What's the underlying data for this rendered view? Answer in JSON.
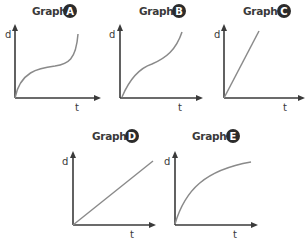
{
  "graphs": [
    {
      "id": "A",
      "title": "Graph",
      "badge": "A",
      "y_label": "d",
      "x_label": "t",
      "shape": "s-curve: rises, plateaus, then rises steeply",
      "curve_path": "M15,98 C20,72 38,68 55,66 C68,64 76,60 78,34"
    },
    {
      "id": "B",
      "title": "Graph",
      "badge": "B",
      "y_label": "d",
      "x_label": "t",
      "shape": "gentle s-curve: rises, slows, then rises again",
      "curve_path": "M122,97 C130,78 140,68 152,64 C166,58 176,50 182,32"
    },
    {
      "id": "C",
      "title": "Graph",
      "badge": "C",
      "y_label": "d",
      "x_label": "t",
      "shape": "steep straight line through origin",
      "curve_path": "M224,98 L259,31"
    },
    {
      "id": "D",
      "title": "Graph",
      "badge": "D",
      "y_label": "d",
      "x_label": "t",
      "shape": "moderate straight line through origin",
      "curve_path": "M73,225 L153,161"
    },
    {
      "id": "E",
      "title": "Graph",
      "badge": "E",
      "y_label": "d",
      "x_label": "t",
      "shape": "concave-down curve that levels off",
      "curve_path": "M175,224 C185,190 205,170 251,162"
    }
  ],
  "colors": {
    "axis": "#3a3a3a",
    "curve": "#8a8a8a",
    "badge_fill": "#2b2b2b",
    "badge_text": "#ffffff"
  }
}
